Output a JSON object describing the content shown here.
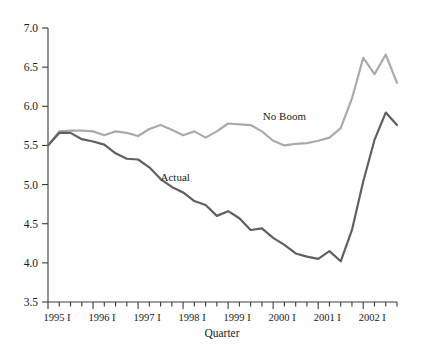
{
  "chart_data": {
    "type": "line",
    "title": "",
    "xlabel": "Quarter",
    "ylabel": "",
    "ylim": [
      3.5,
      7.0
    ],
    "ytick_labels": [
      "3.5",
      "4.0",
      "4.5",
      "5.0",
      "5.5",
      "6.0",
      "6.5",
      "7.0"
    ],
    "ytick_values": [
      3.5,
      4.0,
      4.5,
      5.0,
      5.5,
      6.0,
      6.5,
      7.0
    ],
    "xtick_labels": [
      "1995 I",
      "1996 I",
      "1997 I",
      "1998 I",
      "1999 I",
      "2000 I",
      "2001 I",
      "2002 I"
    ],
    "xtick_indices": [
      0,
      4,
      8,
      12,
      16,
      20,
      24,
      28
    ],
    "grid": false,
    "legend_position": "inline-annotations",
    "x": [
      "1995 I",
      "1995 II",
      "1995 III",
      "1995 IV",
      "1996 I",
      "1996 II",
      "1996 III",
      "1996 IV",
      "1997 I",
      "1997 II",
      "1997 III",
      "1997 IV",
      "1998 I",
      "1998 II",
      "1998 III",
      "1998 IV",
      "1999 I",
      "1999 II",
      "1999 III",
      "1999 IV",
      "2000 I",
      "2000 II",
      "2000 III",
      "2000 IV",
      "2001 I",
      "2001 II",
      "2001 III",
      "2001 IV",
      "2002 I",
      "2002 II",
      "2002 III",
      "2002 IV"
    ],
    "series": [
      {
        "name": "No Boom",
        "color": "#aaaaaa",
        "label_x_index": 21.0,
        "label_y_value": 5.83,
        "values": [
          5.5,
          5.68,
          5.69,
          5.69,
          5.68,
          5.63,
          5.68,
          5.66,
          5.62,
          5.71,
          5.76,
          5.7,
          5.63,
          5.68,
          5.6,
          5.68,
          5.78,
          5.77,
          5.76,
          5.68,
          5.56,
          5.5,
          5.52,
          5.53,
          5.56,
          5.6,
          5.72,
          6.1,
          6.62,
          6.41,
          6.66,
          6.3
        ]
      },
      {
        "name": "Actual",
        "color": "#606060",
        "label_x_index": 11.3,
        "label_y_value": 5.05,
        "values": [
          5.5,
          5.66,
          5.66,
          5.58,
          5.55,
          5.51,
          5.4,
          5.33,
          5.32,
          5.22,
          5.07,
          4.97,
          4.9,
          4.79,
          4.74,
          4.6,
          4.66,
          4.57,
          4.42,
          4.44,
          4.32,
          4.23,
          4.12,
          4.08,
          4.05,
          4.15,
          4.02,
          4.42,
          5.04,
          5.57,
          5.92,
          5.76
        ]
      }
    ]
  }
}
